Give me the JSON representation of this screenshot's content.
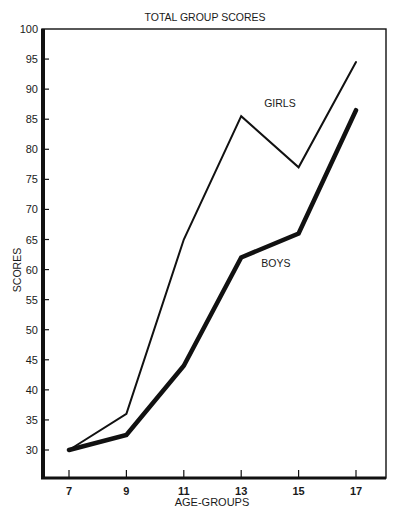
{
  "chart_data": {
    "type": "line",
    "title": "TOTAL GROUP SCORES",
    "xlabel": "AGE-GROUPS",
    "ylabel": "SCORES",
    "x": [
      7,
      9,
      11,
      13,
      15,
      17
    ],
    "x_tick_labels": [
      "7",
      "9",
      "11",
      "13",
      "15",
      "17"
    ],
    "y_tick_labels": [
      "30",
      "35",
      "40",
      "45",
      "50",
      "55",
      "60",
      "65",
      "70",
      "75",
      "80",
      "85",
      "90",
      "95",
      "100"
    ],
    "y_ticks": [
      30,
      35,
      40,
      45,
      50,
      55,
      60,
      65,
      70,
      75,
      80,
      85,
      90,
      95,
      100
    ],
    "ylim": [
      30,
      100
    ],
    "xlim": [
      6,
      18
    ],
    "grid": false,
    "legend": "inline labels",
    "series": [
      {
        "name": "GIRLS",
        "values": [
          30,
          36,
          65,
          85.5,
          77,
          94.5
        ],
        "line_width": 2,
        "color": "#111111",
        "label_pos": {
          "x": 13.8,
          "y": 87
        }
      },
      {
        "name": "BOYS",
        "values": [
          30,
          32.5,
          44,
          62,
          66,
          86.5
        ],
        "line_width": 4.5,
        "color": "#111111",
        "label_pos": {
          "x": 13.7,
          "y": 60.5
        }
      }
    ]
  },
  "layout": {
    "plot": {
      "left": 42,
      "top": 29,
      "right": 386,
      "bottom": 478
    },
    "x_px": {
      "7": 69,
      "17": 356
    },
    "y_px": {
      "30": 450,
      "100": 29
    }
  }
}
